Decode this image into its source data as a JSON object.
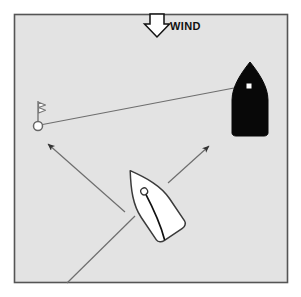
{
  "scene": {
    "title": "Sailing right-of-way diagram",
    "frame": {
      "border_color": "#555555",
      "fill_color": "#e3e3e3",
      "x": 14,
      "y": 14,
      "width": 274,
      "height": 269
    }
  },
  "wind": {
    "label": "WIND",
    "label_x": 170,
    "label_y": 21,
    "arrow_color_fill": "#ffffff",
    "arrow_color_stroke": "#111111",
    "arrow_x": 155,
    "arrow_y": 14,
    "direction": "down"
  },
  "boats": [
    {
      "id": "black-boat",
      "name": "black-boat",
      "fill": "#080808",
      "stroke": "#080808",
      "mast_dot_color": "#ffffff",
      "mast_x": 249,
      "mast_y": 86,
      "bow_x": 250,
      "bow_y": 63,
      "stern_y": 135,
      "beam": 18,
      "heading_deg": 180
    },
    {
      "id": "white-boat",
      "name": "white-boat",
      "fill": "#ffffff",
      "stroke": "#3b3b3b",
      "mast_dot_color": "#ffffff",
      "mast_x": 152,
      "mast_y": 196,
      "heading_deg": -34,
      "sail_stroke": "#111111"
    }
  ],
  "mark": {
    "id": "buoy-mark",
    "name": "buoy-with-flag",
    "circle_x": 38,
    "circle_y": 126,
    "circle_r": 4.5,
    "pole_top_y": 101,
    "flag_color": "#ffffff",
    "stroke": "#666666"
  },
  "lines": [
    {
      "id": "sight-line",
      "name": "mark-to-black-boat-sight-line",
      "x1": 40,
      "y1": 125,
      "x2": 234,
      "y2": 88,
      "color": "#6e6e6e",
      "width": 1.2,
      "arrow": "none"
    },
    {
      "id": "track-line",
      "name": "white-boat-track-line",
      "x1": 67,
      "y1": 283,
      "x2": 135,
      "y2": 216,
      "color": "#6e6e6e",
      "width": 1.2,
      "arrow": "none"
    },
    {
      "id": "port-tack-arrow",
      "name": "port-option-arrow",
      "x1": 125,
      "y1": 212,
      "x2": 48,
      "y2": 144,
      "color": "#6e6e6e",
      "width": 1.2,
      "arrow": "end"
    },
    {
      "id": "starboard-tack-arrow",
      "name": "starboard-option-arrow",
      "x1": 168,
      "y1": 183,
      "x2": 209,
      "y2": 146,
      "color": "#6e6e6e",
      "width": 1.2,
      "arrow": "end"
    }
  ]
}
